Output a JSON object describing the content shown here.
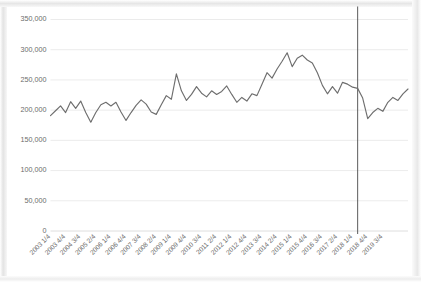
{
  "figure": {
    "background_color": "#ffffff",
    "frame_color": "#d9d9d9",
    "line_color": "#6e6e6e",
    "grid_color": "#e2e2e2",
    "marker_line_color": "#4a4a4a"
  },
  "chart_data": {
    "type": "line",
    "title": "",
    "subtitle": "",
    "xlabel": "",
    "ylabel": "",
    "ylim": [
      0,
      350000
    ],
    "ytick_labels": [
      "350,000",
      "300,000",
      "250,000",
      "200,000",
      "150,000",
      "100,000",
      "50,000",
      "0"
    ],
    "ytick_values": [
      350000,
      300000,
      250000,
      200000,
      150000,
      100000,
      50000,
      0
    ],
    "grid": true,
    "grid_axis": "y",
    "legend": false,
    "legend_position": "none",
    "xtick_labels": [
      "2003 1/4",
      "2003 4/4",
      "2004 3/4",
      "2005 2/4",
      "2006 1/4",
      "2006 4/4",
      "2007 3/4",
      "2008 2/4",
      "2009 1/4",
      "2009 4/4",
      "2010 3/4",
      "2011 2/4",
      "2012 1/4",
      "2012 4/4",
      "2013 3/4",
      "2014 2/4",
      "2015 1/4",
      "2015 4/4",
      "2016 3/4",
      "2017 2/4",
      "2018 1/4",
      "2018 4/4",
      "2019 3/4"
    ],
    "xtick_step_quarters": 3,
    "x": [
      "2003 1/4",
      "2003 2/4",
      "2003 3/4",
      "2003 4/4",
      "2004 1/4",
      "2004 2/4",
      "2004 3/4",
      "2004 4/4",
      "2005 1/4",
      "2005 2/4",
      "2005 3/4",
      "2005 4/4",
      "2006 1/4",
      "2006 2/4",
      "2006 3/4",
      "2006 4/4",
      "2007 1/4",
      "2007 2/4",
      "2007 3/4",
      "2007 4/4",
      "2008 1/4",
      "2008 2/4",
      "2008 3/4",
      "2008 4/4",
      "2009 1/4",
      "2009 2/4",
      "2009 3/4",
      "2009 4/4",
      "2010 1/4",
      "2010 2/4",
      "2010 3/4",
      "2010 4/4",
      "2011 1/4",
      "2011 2/4",
      "2011 3/4",
      "2011 4/4",
      "2012 1/4",
      "2012 2/4",
      "2012 3/4",
      "2012 4/4",
      "2013 1/4",
      "2013 2/4",
      "2013 3/4",
      "2013 4/4",
      "2014 1/4",
      "2014 2/4",
      "2014 3/4",
      "2014 4/4",
      "2015 1/4",
      "2015 2/4",
      "2015 3/4",
      "2015 4/4",
      "2016 1/4",
      "2016 2/4",
      "2016 3/4",
      "2016 4/4",
      "2017 1/4",
      "2017 2/4",
      "2017 3/4",
      "2017 4/4",
      "2018 1/4",
      "2018 2/4",
      "2018 3/4",
      "2018 4/4",
      "2019 1/4",
      "2019 2/4",
      "2019 3/4",
      "2019 4/4",
      "2020 1/4",
      "2020 2/4",
      "2020 3/4",
      "2020 4/4"
    ],
    "values": [
      191000,
      199000,
      207000,
      196000,
      214000,
      203000,
      215000,
      196000,
      180000,
      196000,
      209000,
      213000,
      207000,
      213000,
      197000,
      183000,
      196000,
      208000,
      217000,
      210000,
      197000,
      193000,
      209000,
      224000,
      218000,
      260000,
      232000,
      216000,
      226000,
      239000,
      228000,
      222000,
      232000,
      226000,
      231000,
      240000,
      226000,
      213000,
      221000,
      215000,
      227000,
      224000,
      243000,
      262000,
      253000,
      268000,
      281000,
      295000,
      272000,
      286000,
      291000,
      283000,
      278000,
      262000,
      241000,
      227000,
      239000,
      228000,
      246000,
      243000,
      238000,
      236000,
      220000,
      186000,
      196000,
      203000,
      198000,
      213000,
      221000,
      216000,
      227000,
      235000
    ],
    "annotations": [
      {
        "type": "vertical-reference-line",
        "x": "2018 2/4",
        "label": "",
        "color": "#4a4a4a"
      }
    ]
  }
}
